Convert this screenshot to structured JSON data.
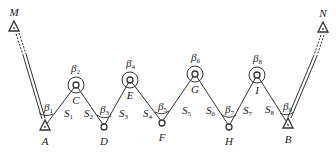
{
  "diagram": {
    "type": "traverse survey (zigzag connecting traverse between known stations)",
    "colors": {
      "line": "#333333",
      "text": "#222222",
      "background": "#ffffff"
    },
    "control_points": [
      {
        "id": "M",
        "label": "M",
        "symbol": "triangle",
        "x": 14,
        "y": 27
      },
      {
        "id": "A",
        "label": "A",
        "symbol": "triangle",
        "x": 45,
        "y": 126
      },
      {
        "id": "B",
        "label": "B",
        "symbol": "triangle",
        "x": 288,
        "y": 124
      },
      {
        "id": "N",
        "label": "N",
        "symbol": "triangle",
        "x": 323,
        "y": 28
      }
    ],
    "traverse_points": [
      {
        "id": "C",
        "label": "C",
        "x": 76,
        "y": 85,
        "ring": true
      },
      {
        "id": "D",
        "label": "D",
        "x": 104,
        "y": 126,
        "ring": false
      },
      {
        "id": "E",
        "label": "E",
        "x": 130,
        "y": 80,
        "ring": true
      },
      {
        "id": "F",
        "label": "F",
        "x": 162,
        "y": 122,
        "ring": false
      },
      {
        "id": "G",
        "label": "G",
        "x": 195,
        "y": 74,
        "ring": true
      },
      {
        "id": "H",
        "label": "H",
        "x": 229,
        "y": 126,
        "ring": false
      },
      {
        "id": "I",
        "label": "I",
        "x": 257,
        "y": 75,
        "ring": true
      }
    ],
    "angles": [
      {
        "symbol": "β",
        "sub": "1",
        "at": "A"
      },
      {
        "symbol": "β",
        "sub": "2",
        "at": "C"
      },
      {
        "symbol": "β",
        "sub": "3",
        "at": "D"
      },
      {
        "symbol": "β",
        "sub": "4",
        "at": "E"
      },
      {
        "symbol": "β",
        "sub": "5",
        "at": "F"
      },
      {
        "symbol": "β",
        "sub": "6",
        "at": "G"
      },
      {
        "symbol": "β",
        "sub": "7",
        "at": "H"
      },
      {
        "symbol": "β",
        "sub": "8",
        "at": "I"
      },
      {
        "symbol": "β",
        "sub": "9",
        "at": "B"
      }
    ],
    "sides": [
      {
        "symbol": "S",
        "sub": "1",
        "from": "A",
        "to": "C"
      },
      {
        "symbol": "S",
        "sub": "2",
        "from": "C",
        "to": "D"
      },
      {
        "symbol": "S",
        "sub": "3",
        "from": "D",
        "to": "E"
      },
      {
        "symbol": "S",
        "sub": "4",
        "from": "E",
        "to": "F"
      },
      {
        "symbol": "S",
        "sub": "5",
        "from": "F",
        "to": "G"
      },
      {
        "symbol": "S",
        "sub": "6",
        "from": "G",
        "to": "H"
      },
      {
        "symbol": "S",
        "sub": "7",
        "from": "H",
        "to": "I"
      },
      {
        "symbol": "S",
        "sub": "8",
        "from": "I",
        "to": "B"
      }
    ],
    "known_directions": [
      {
        "from": "M",
        "to": "A",
        "style": "double-line"
      },
      {
        "from": "N",
        "to": "B",
        "style": "double-line"
      }
    ]
  }
}
